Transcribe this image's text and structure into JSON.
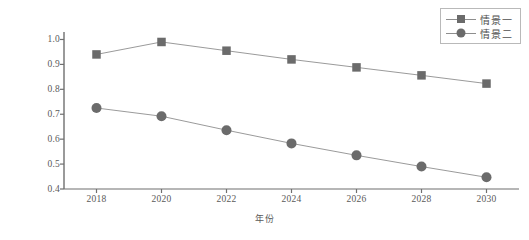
{
  "chart_data": {
    "type": "line",
    "title": "",
    "xlabel": "年份",
    "ylabel": "能耗/碳排放量",
    "categories": [
      2018,
      2020,
      2022,
      2024,
      2026,
      2028,
      2030
    ],
    "x": [
      2018,
      2020,
      2022,
      2024,
      2026,
      2028,
      2030
    ],
    "xlim": [
      2017,
      2031
    ],
    "ylim": [
      0.4,
      1.03
    ],
    "yticks": [
      0.4,
      0.5,
      0.6,
      0.7,
      0.8,
      0.9,
      1.0
    ],
    "ytick_labels": [
      "0.4",
      "0.5",
      "0.6",
      "0.7",
      "0.8",
      "0.9",
      "1.0"
    ],
    "xtick_labels": [
      "2018",
      "2020",
      "2022",
      "2024",
      "2026",
      "2028",
      "2030"
    ],
    "grid": false,
    "legend_position": "top-right",
    "series": [
      {
        "name": "情景一",
        "marker": "square",
        "color": "#6b6b6b",
        "line_color": "#8e8e8e",
        "values": [
          0.94,
          0.99,
          0.955,
          0.92,
          0.888,
          0.856,
          0.823
        ]
      },
      {
        "name": "情景二",
        "marker": "circle",
        "color": "#6b6b6b",
        "line_color": "#8e8e8e",
        "values": [
          0.725,
          0.692,
          0.636,
          0.583,
          0.535,
          0.49,
          0.447
        ]
      }
    ]
  },
  "legend": {
    "items": [
      {
        "label": "情景一",
        "marker": "square"
      },
      {
        "label": "情景二",
        "marker": "circle"
      }
    ]
  },
  "axes": {
    "y_axis_label": "能耗/碳排放量",
    "x_axis_label": "年份"
  }
}
